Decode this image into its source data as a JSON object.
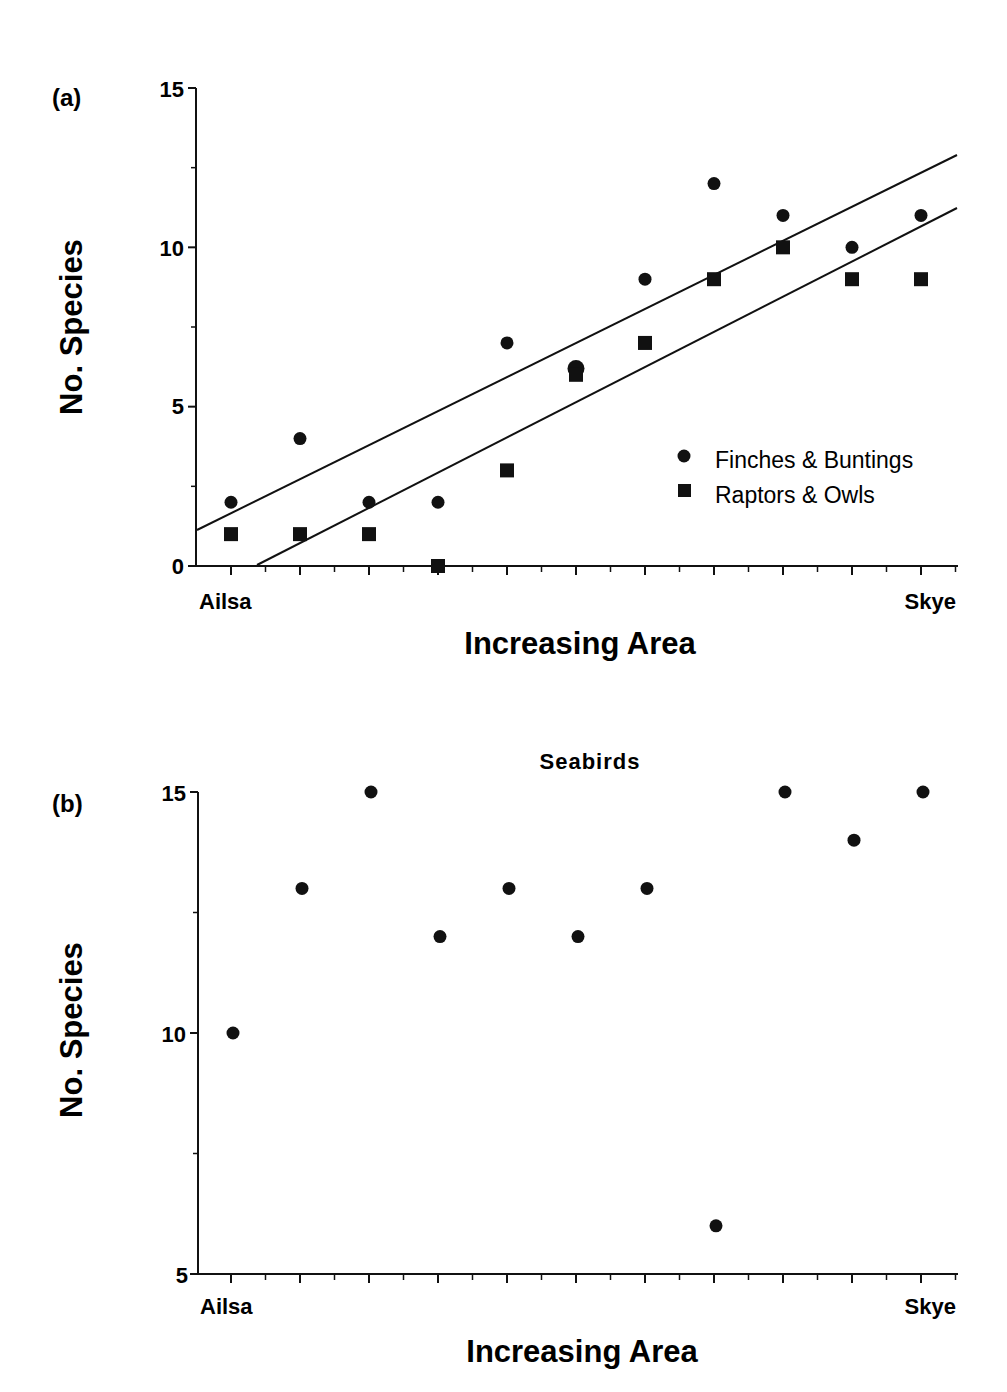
{
  "chart_data": [
    {
      "panel": "(a)",
      "type": "scatter",
      "title": "",
      "xlabel": "Increasing Area",
      "ylabel": "No. Species",
      "x_endpoint_labels": [
        "Ailsa",
        "Skye"
      ],
      "x": [
        1,
        2,
        3,
        4,
        5,
        6,
        7,
        8,
        9,
        10,
        11
      ],
      "ylim": [
        0,
        15
      ],
      "yticks": [
        0,
        5,
        10,
        15
      ],
      "y_minor_ticks": [
        2.5,
        7.5,
        12.5
      ],
      "grid": false,
      "legend_position": "lower right",
      "series": [
        {
          "name": "Finches & Buntings",
          "marker": "circle",
          "values": [
            2,
            4,
            2,
            2,
            7,
            6.2,
            9,
            12,
            11,
            10,
            11
          ],
          "fit_line": {
            "x0": 0.5,
            "y0": 1.1,
            "x1": 11.5,
            "y1": 12.9
          }
        },
        {
          "name": "Raptors & Owls",
          "marker": "square",
          "values": [
            1,
            1,
            1,
            0,
            3,
            6,
            7,
            9,
            10,
            9,
            9
          ],
          "fit_line": {
            "x0": 1.35,
            "y0": 0,
            "x1": 11.5,
            "y1": 11.2
          }
        }
      ]
    },
    {
      "panel": "(b)",
      "type": "scatter",
      "title": "Seabirds",
      "xlabel": "Increasing Area",
      "ylabel": "No. Species",
      "x_endpoint_labels": [
        "Ailsa",
        "Skye"
      ],
      "x": [
        1,
        2,
        3,
        4,
        5,
        6,
        7,
        8,
        9,
        10,
        11
      ],
      "ylim": [
        5,
        15
      ],
      "yticks": [
        5,
        10,
        15
      ],
      "y_minor_ticks": [
        7.5,
        12.5
      ],
      "grid": false,
      "series": [
        {
          "name": "Seabirds",
          "marker": "circle",
          "values": [
            10,
            13,
            15,
            12,
            13,
            12,
            13,
            6,
            15,
            14,
            15
          ]
        }
      ]
    }
  ],
  "labels": {
    "panel_a": "(a)",
    "panel_b": "(b)",
    "ylabel": "No. Species",
    "xlabel": "Increasing Area",
    "left_cat": "Ailsa",
    "right_cat": "Skye",
    "b_title": "Seabirds",
    "legend_finches": "Finches & Buntings",
    "legend_raptors": "Raptors & Owls",
    "a_ticks": [
      "0",
      "5",
      "10",
      "15"
    ],
    "b_ticks": [
      "5",
      "10",
      "15"
    ]
  },
  "colors": {
    "ink": "#111111",
    "background": "#ffffff"
  }
}
